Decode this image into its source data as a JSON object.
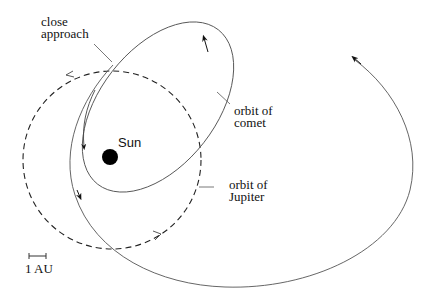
{
  "diagram": {
    "labels": {
      "close_approach": [
        "close",
        "approach"
      ],
      "orbit_comet": [
        "orbit of",
        "comet"
      ],
      "orbit_jupiter": [
        "orbit of",
        "Jupiter"
      ],
      "sun": "Sun",
      "scale": "1 AU"
    },
    "elements": {
      "jupiter_orbit": "dashed circle centered on Sun",
      "comet_orbit": "tilted ellipse around Sun",
      "comet_trajectory": "large loop after close approach"
    },
    "colors": {
      "line": "#333333",
      "sun": "#000000",
      "background": "#ffffff"
    }
  }
}
